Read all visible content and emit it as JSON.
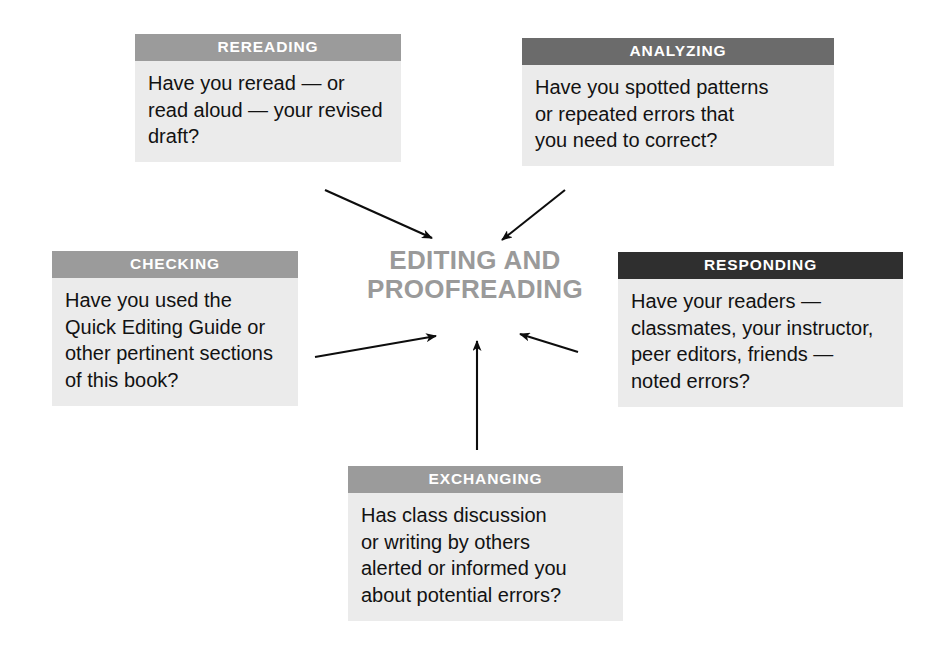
{
  "diagram": {
    "title": "EDITING AND PROOFREADING",
    "center": {
      "lines": [
        "EDITING AND",
        "PROOFREADING"
      ],
      "color": "#9a9a9a"
    },
    "colors": {
      "page_background": "#ffffff",
      "box_body_background": "#ebebeb",
      "header_mid_gray": "#9b9b9b",
      "header_dark_gray": "#6b6b6b",
      "header_black": "#2f2f2f",
      "body_text": "#121212",
      "header_text": "#ffffff",
      "arrow": "#0d0d0d"
    },
    "nodes": [
      {
        "id": "rereading",
        "header": "REREADING",
        "header_tone": "#9b9b9b",
        "lines": [
          "Have you reread — or",
          "read aloud — your revised",
          "draft?"
        ]
      },
      {
        "id": "analyzing",
        "header": "ANALYZING",
        "header_tone": "#6b6b6b",
        "lines": [
          "Have you spotted patterns",
          "or repeated errors that",
          "you need to correct?"
        ]
      },
      {
        "id": "checking",
        "header": "CHECKING",
        "header_tone": "#9b9b9b",
        "lines": [
          "Have you used the",
          "Quick Editing Guide or",
          "other pertinent sections",
          "of this book?"
        ]
      },
      {
        "id": "responding",
        "header": "RESPONDING",
        "header_tone": "#2f2f2f",
        "lines": [
          "Have your readers —",
          "classmates, your instructor,",
          "peer editors, friends —",
          "noted errors?"
        ]
      },
      {
        "id": "exchanging",
        "header": "EXCHANGING",
        "header_tone": "#9b9b9b",
        "lines": [
          "Has class discussion",
          "or writing by others",
          "alerted or informed you",
          "about potential errors?"
        ]
      }
    ],
    "arrows": [
      {
        "id": "rereading-to-center",
        "from": "rereading",
        "to": "center",
        "direction": "down-right"
      },
      {
        "id": "analyzing-to-center",
        "from": "analyzing",
        "to": "center",
        "direction": "down-left"
      },
      {
        "id": "checking-to-center",
        "from": "checking",
        "to": "center",
        "direction": "up-right"
      },
      {
        "id": "responding-to-center",
        "from": "responding",
        "to": "center",
        "direction": "up-left"
      },
      {
        "id": "exchanging-to-center",
        "from": "exchanging",
        "to": "center",
        "direction": "up"
      }
    ]
  }
}
